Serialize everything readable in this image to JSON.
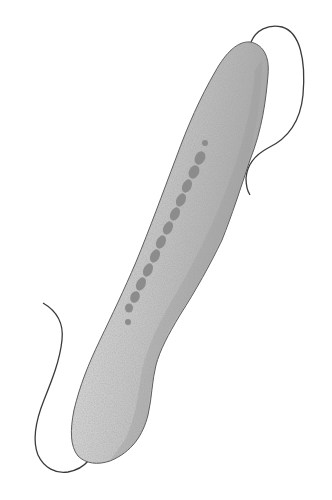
{
  "illustration": {
    "subject": "elongated protist cell with two flagella and beaded macronucleus",
    "colors": {
      "background": "#ffffff",
      "body_fill": "#cfcfcf",
      "body_fill_dark": "#a9a9a9",
      "outline": "#5a5a5a",
      "nucleus": "#8a8a8a",
      "flagellum": "#3a3a3a"
    }
  }
}
